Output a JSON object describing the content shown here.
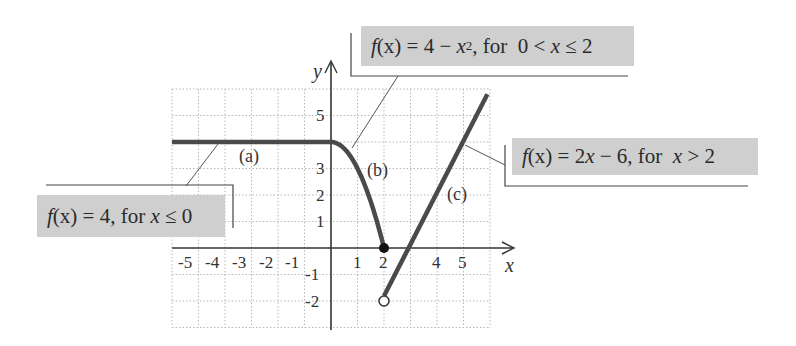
{
  "chart_data": {
    "type": "line",
    "title": "",
    "xlabel": "x",
    "ylabel": "y",
    "xlim": [
      -6,
      6
    ],
    "ylim": [
      -3,
      6
    ],
    "grid": true,
    "x_ticks": [
      "-5",
      "-4",
      "-3",
      "-2",
      "-1",
      "1",
      "2",
      "4",
      "5"
    ],
    "y_ticks": [
      "5",
      "3",
      "2",
      "1",
      "-1",
      "-2"
    ],
    "series": [
      {
        "name": "(a)",
        "label": "f(x) = 4, for x ≤ 0",
        "expression": "4",
        "domain": [
          -6,
          0
        ],
        "points": [
          [
            -6,
            4
          ],
          [
            0,
            4
          ]
        ]
      },
      {
        "name": "(b)",
        "label": "f(x) = 4 − x², for 0 < x ≤ 2",
        "expression": "4 - x^2",
        "domain": [
          0,
          2
        ],
        "points": [
          [
            0,
            4
          ],
          [
            0.5,
            3.75
          ],
          [
            1,
            3
          ],
          [
            1.5,
            1.75
          ],
          [
            2,
            0
          ]
        ]
      },
      {
        "name": "(c)",
        "label": "f(x) = 2x − 6, for x > 2",
        "expression": "2x - 6",
        "domain": [
          2,
          5.9
        ],
        "points": [
          [
            2,
            -2
          ],
          [
            3,
            0
          ],
          [
            4,
            2
          ],
          [
            5,
            4
          ],
          [
            5.9,
            5.8
          ]
        ]
      }
    ],
    "annotations": [
      {
        "type": "closed-point",
        "x": 2,
        "y": 0
      },
      {
        "type": "open-point",
        "x": 2,
        "y": -2
      }
    ]
  },
  "labels": {
    "a": {
      "prefix": "f",
      "arg": "(x)",
      "body": " = 4, for ",
      "var": "x",
      "cond": " ≤ 0"
    },
    "b": {
      "prefix": "f",
      "arg": "(x)",
      "body": " = 4 − ",
      "var": "x",
      "sup": "2",
      "tail": ", for  0 < ",
      "var2": "x",
      "cond": " ≤ 2"
    },
    "c": {
      "prefix": "f",
      "arg": "(x)",
      "body": " = 2",
      "var": "x",
      "mid": " − 6, for  ",
      "var2": "x",
      "cond": " > 2"
    }
  },
  "piece_tags": {
    "a": "(a)",
    "b": "(b)",
    "c": "(c)"
  },
  "axis_names": {
    "x": "x",
    "y": "y"
  },
  "colors": {
    "curve": "#4a4a4a",
    "grid": "#b8b8b8",
    "axis": "#333333",
    "label_fill": "#cfcfcf"
  }
}
